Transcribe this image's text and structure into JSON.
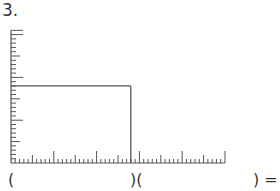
{
  "question": {
    "number_label": "3.",
    "grid": {
      "x_units": 50,
      "y_units": 31,
      "minor_tick_every": 1,
      "medium_tick_every": 5,
      "long_tick_every": 10,
      "rectangle": {
        "width_units": 28,
        "height_units": 18
      },
      "line_color": "#555555"
    },
    "equation": {
      "open_paren_1": "(",
      "close_open": ")(",
      "close_equals": ") ="
    }
  }
}
